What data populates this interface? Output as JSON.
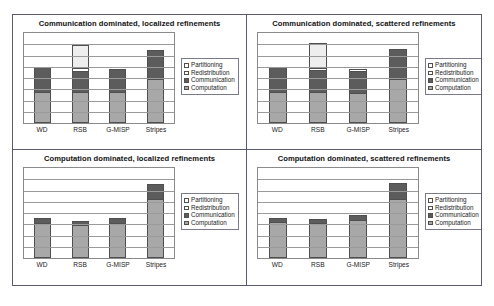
{
  "figure": {
    "categories": [
      "WD",
      "RSB",
      "G-MISP",
      "Stripes"
    ],
    "series_names": [
      "Partitioning",
      "Redistribution",
      "Communication",
      "Computation"
    ],
    "colors": {
      "computation": "#a8a8a8",
      "communication": "#5c5c5c",
      "redistribution": "#ffffff",
      "partitioning": "#eeeeee",
      "gridline": "#9a9a9a",
      "border": "#5a5a6e"
    }
  },
  "panels": [
    {
      "title": "Communication dominated, localized refinements",
      "legend": [
        "Partitioning",
        "Redistribution",
        "Communication",
        "Computation"
      ],
      "xticks": [
        "WD",
        "RSB",
        "G-MISP",
        "Stripes"
      ]
    },
    {
      "title": "Communication dominated, scattered refinements",
      "legend": [
        "Partitioning",
        "Redistribution",
        "Communication",
        "Computation"
      ],
      "xticks": [
        "WD",
        "RSB",
        "G-MISP",
        "Stripes"
      ]
    },
    {
      "title": "Computation dominated, localized refinements",
      "legend": [
        "Partitioning",
        "Redistribution",
        "Communication",
        "Computation"
      ],
      "xticks": [
        "WD",
        "RSB",
        "G-MISP",
        "Stripes"
      ]
    },
    {
      "title": "Computation dominated, scattered refinements",
      "legend": [
        "Partitioning",
        "Redistribution",
        "Communication",
        "Computation"
      ],
      "xticks": [
        "WD",
        "RSB",
        "G-MISP",
        "Stripes"
      ]
    }
  ],
  "chart_data": [
    {
      "type": "bar",
      "stacked": true,
      "title": "Communication dominated, localized refinements",
      "xlabel": "",
      "ylabel": "",
      "ylim": [
        0,
        100
      ],
      "grid": true,
      "gridline_count": 7,
      "legend_position": "right",
      "categories": [
        "WD",
        "RSB",
        "G-MISP",
        "Stripes"
      ],
      "series": [
        {
          "name": "Computation",
          "values": [
            34,
            34,
            34,
            49
          ]
        },
        {
          "name": "Communication",
          "values": [
            28,
            24,
            26,
            32
          ]
        },
        {
          "name": "Redistribution",
          "values": [
            0,
            2,
            0,
            0
          ]
        },
        {
          "name": "Partitioning",
          "values": [
            0,
            27,
            0,
            0
          ]
        }
      ],
      "totals": [
        62,
        87,
        60,
        81
      ]
    },
    {
      "type": "bar",
      "stacked": true,
      "title": "Communication dominated, scattered refinements",
      "xlabel": "",
      "ylabel": "",
      "ylim": [
        0,
        100
      ],
      "grid": true,
      "gridline_count": 7,
      "legend_position": "right",
      "categories": [
        "WD",
        "RSB",
        "G-MISP",
        "Stripes"
      ],
      "series": [
        {
          "name": "Computation",
          "values": [
            34,
            34,
            34,
            49
          ]
        },
        {
          "name": "Communication",
          "values": [
            28,
            25,
            25,
            33
          ]
        },
        {
          "name": "Redistribution",
          "values": [
            0,
            2,
            1,
            0
          ]
        },
        {
          "name": "Partitioning",
          "values": [
            0,
            28,
            0,
            0
          ]
        }
      ],
      "totals": [
        62,
        89,
        60,
        82
      ]
    },
    {
      "type": "bar",
      "stacked": true,
      "title": "Computation dominated, localized refinements",
      "xlabel": "",
      "ylabel": "",
      "ylim": [
        0,
        100
      ],
      "grid": true,
      "gridline_count": 7,
      "legend_position": "right",
      "categories": [
        "WD",
        "RSB",
        "G-MISP",
        "Stripes"
      ],
      "series": [
        {
          "name": "Computation",
          "values": [
            40,
            38,
            40,
            66
          ]
        },
        {
          "name": "Communication",
          "values": [
            4,
            3,
            4,
            16
          ]
        },
        {
          "name": "Redistribution",
          "values": [
            0,
            0,
            0,
            0
          ]
        },
        {
          "name": "Partitioning",
          "values": [
            0,
            0,
            0,
            0
          ]
        }
      ],
      "totals": [
        44,
        41,
        44,
        82
      ]
    },
    {
      "type": "bar",
      "stacked": true,
      "title": "Computation dominated, scattered refinements",
      "xlabel": "",
      "ylabel": "",
      "ylim": [
        0,
        100
      ],
      "grid": true,
      "gridline_count": 7,
      "legend_position": "right",
      "categories": [
        "WD",
        "RSB",
        "G-MISP",
        "Stripes"
      ],
      "series": [
        {
          "name": "Computation",
          "values": [
            41,
            40,
            43,
            66
          ]
        },
        {
          "name": "Communication",
          "values": [
            4,
            3,
            5,
            17
          ]
        },
        {
          "name": "Redistribution",
          "values": [
            0,
            0,
            0,
            0
          ]
        },
        {
          "name": "Partitioning",
          "values": [
            0,
            0,
            0,
            0
          ]
        }
      ],
      "totals": [
        45,
        43,
        48,
        83
      ]
    }
  ]
}
